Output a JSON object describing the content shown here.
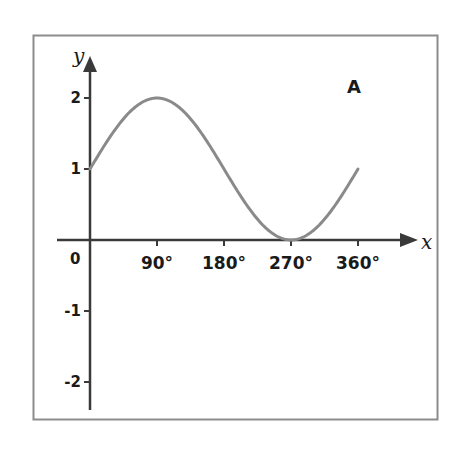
{
  "chart_data": {
    "type": "line",
    "title": "",
    "panel_label": "A",
    "xlabel": "x",
    "ylabel": "y",
    "function": "y = 1 + sin(x)",
    "x_ticks": [
      {
        "value": 90,
        "label": "90°"
      },
      {
        "value": 180,
        "label": "180°"
      },
      {
        "value": 270,
        "label": "270°"
      },
      {
        "value": 360,
        "label": "360°"
      }
    ],
    "origin_label": "0",
    "y_ticks": [
      {
        "value": 2,
        "label": "2"
      },
      {
        "value": 1,
        "label": "1"
      },
      {
        "value": -1,
        "label": "-1"
      },
      {
        "value": -2,
        "label": "-2"
      }
    ],
    "xlim": [
      0,
      360
    ],
    "ylim": [
      -2.4,
      2.6
    ],
    "grid": false,
    "legend": null,
    "series": [
      {
        "name": "curve",
        "color": "#8a8a8a",
        "x": [
          0,
          30,
          60,
          90,
          120,
          150,
          180,
          210,
          240,
          270,
          300,
          330,
          360
        ],
        "y": [
          1,
          1.5,
          1.87,
          2,
          1.87,
          1.5,
          1,
          0.5,
          0.13,
          0,
          0.13,
          0.5,
          1
        ]
      }
    ]
  },
  "colors": {
    "frame": "#8c8c8c",
    "axes": "#3a3a3a",
    "curve": "#8a8a8a",
    "text": "#1a1a1a"
  }
}
